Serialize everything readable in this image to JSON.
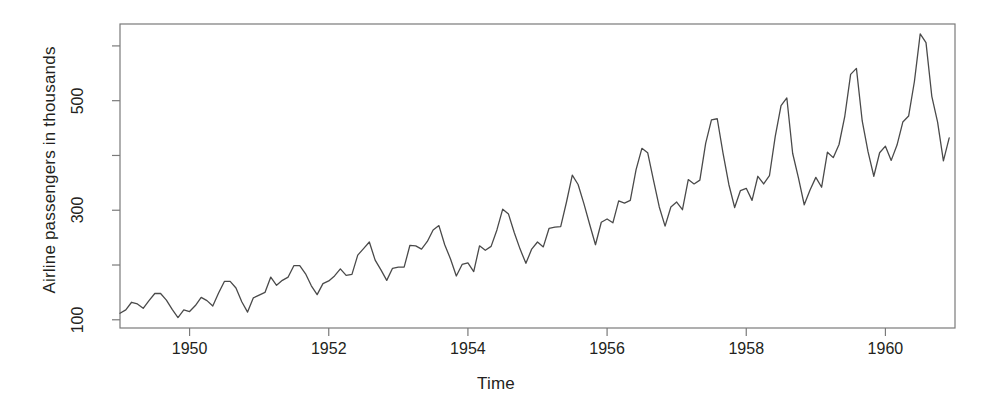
{
  "chart_data": {
    "type": "line",
    "title": "",
    "xlabel": "Time",
    "ylabel": "Airline passengers in thousands",
    "xlim": [
      1949.0,
      1961.0
    ],
    "ylim": [
      85,
      640
    ],
    "grid": false,
    "legend": "none",
    "x_ticks": [
      {
        "value": 1950,
        "label": "1950"
      },
      {
        "value": 1952,
        "label": "1952"
      },
      {
        "value": 1954,
        "label": "1954"
      },
      {
        "value": 1956,
        "label": "1956"
      },
      {
        "value": 1958,
        "label": "1958"
      },
      {
        "value": 1960,
        "label": "1960"
      }
    ],
    "y_ticks": [
      {
        "value": 100,
        "label": "100"
      },
      {
        "value": 200,
        "label": ""
      },
      {
        "value": 300,
        "label": "300"
      },
      {
        "value": 400,
        "label": ""
      },
      {
        "value": 500,
        "label": "500"
      },
      {
        "value": 600,
        "label": ""
      }
    ],
    "line_color": "#4a4a4a",
    "axis_color": "#7a7a7a",
    "series": [
      {
        "name": "AirPassengers",
        "x": [
          1949.0,
          1949.0833,
          1949.1667,
          1949.25,
          1949.3333,
          1949.4167,
          1949.5,
          1949.5833,
          1949.6667,
          1949.75,
          1949.8333,
          1949.9167,
          1950.0,
          1950.0833,
          1950.1667,
          1950.25,
          1950.3333,
          1950.4167,
          1950.5,
          1950.5833,
          1950.6667,
          1950.75,
          1950.8333,
          1950.9167,
          1951.0,
          1951.0833,
          1951.1667,
          1951.25,
          1951.3333,
          1951.4167,
          1951.5,
          1951.5833,
          1951.6667,
          1951.75,
          1951.8333,
          1951.9167,
          1952.0,
          1952.0833,
          1952.1667,
          1952.25,
          1952.3333,
          1952.4167,
          1952.5,
          1952.5833,
          1952.6667,
          1952.75,
          1952.8333,
          1952.9167,
          1953.0,
          1953.0833,
          1953.1667,
          1953.25,
          1953.3333,
          1953.4167,
          1953.5,
          1953.5833,
          1953.6667,
          1953.75,
          1953.8333,
          1953.9167,
          1954.0,
          1954.0833,
          1954.1667,
          1954.25,
          1954.3333,
          1954.4167,
          1954.5,
          1954.5833,
          1954.6667,
          1954.75,
          1954.8333,
          1954.9167,
          1955.0,
          1955.0833,
          1955.1667,
          1955.25,
          1955.3333,
          1955.4167,
          1955.5,
          1955.5833,
          1955.6667,
          1955.75,
          1955.8333,
          1955.9167,
          1956.0,
          1956.0833,
          1956.1667,
          1956.25,
          1956.3333,
          1956.4167,
          1956.5,
          1956.5833,
          1956.6667,
          1956.75,
          1956.8333,
          1956.9167,
          1957.0,
          1957.0833,
          1957.1667,
          1957.25,
          1957.3333,
          1957.4167,
          1957.5,
          1957.5833,
          1957.6667,
          1957.75,
          1957.8333,
          1957.9167,
          1958.0,
          1958.0833,
          1958.1667,
          1958.25,
          1958.3333,
          1958.4167,
          1958.5,
          1958.5833,
          1958.6667,
          1958.75,
          1958.8333,
          1958.9167,
          1959.0,
          1959.0833,
          1959.1667,
          1959.25,
          1959.3333,
          1959.4167,
          1959.5,
          1959.5833,
          1959.6667,
          1959.75,
          1959.8333,
          1959.9167,
          1960.0,
          1960.0833,
          1960.1667,
          1960.25,
          1960.3333,
          1960.4167,
          1960.5,
          1960.5833,
          1960.6667,
          1960.75,
          1960.8333,
          1960.9167
        ],
        "values": [
          112,
          118,
          132,
          129,
          121,
          135,
          148,
          148,
          136,
          119,
          104,
          118,
          115,
          126,
          141,
          135,
          125,
          149,
          170,
          170,
          158,
          133,
          114,
          140,
          145,
          150,
          178,
          163,
          172,
          178,
          199,
          199,
          184,
          162,
          146,
          166,
          171,
          180,
          193,
          181,
          183,
          218,
          230,
          242,
          209,
          191,
          172,
          194,
          196,
          196,
          236,
          235,
          229,
          243,
          264,
          272,
          237,
          211,
          180,
          201,
          204,
          188,
          235,
          227,
          234,
          264,
          302,
          293,
          259,
          229,
          203,
          229,
          242,
          233,
          267,
          269,
          270,
          315,
          364,
          347,
          312,
          274,
          237,
          278,
          284,
          277,
          317,
          313,
          318,
          374,
          413,
          405,
          355,
          306,
          271,
          306,
          315,
          301,
          356,
          348,
          355,
          422,
          465,
          467,
          404,
          347,
          305,
          336,
          340,
          318,
          362,
          348,
          363,
          435,
          491,
          505,
          404,
          359,
          310,
          337,
          360,
          342,
          406,
          396,
          420,
          472,
          548,
          559,
          463,
          407,
          362,
          405,
          417,
          391,
          419,
          461,
          472,
          535,
          622,
          606,
          508,
          461,
          390,
          432
        ]
      }
    ]
  }
}
